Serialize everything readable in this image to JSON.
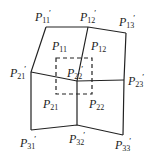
{
  "diagram": {
    "type": "bilinear-patch-mesh",
    "colors": {
      "stroke": "#222222",
      "background": "#ffffff"
    },
    "control_points": [
      {
        "id": "p11",
        "base": "P",
        "sub": "11",
        "prime": "′",
        "x": 46,
        "y": 27
      },
      {
        "id": "p12",
        "base": "P",
        "sub": "12",
        "prime": "′",
        "x": 88,
        "y": 27
      },
      {
        "id": "p13",
        "base": "P",
        "sub": "13",
        "prime": "′",
        "x": 126,
        "y": 33
      },
      {
        "id": "p21",
        "base": "P",
        "sub": "21",
        "prime": "′",
        "x": 31,
        "y": 72
      },
      {
        "id": "p22",
        "base": "P",
        "sub": "22",
        "prime": "′",
        "x": 77,
        "y": 81
      },
      {
        "id": "p23",
        "base": "P",
        "sub": "23",
        "prime": "′",
        "x": 124,
        "y": 80
      },
      {
        "id": "p31",
        "base": "P",
        "sub": "31",
        "prime": "′",
        "x": 31,
        "y": 130
      },
      {
        "id": "p32",
        "base": "P",
        "sub": "32",
        "prime": "′",
        "x": 77,
        "y": 125
      },
      {
        "id": "p33",
        "base": "P",
        "sub": "33",
        "prime": "′",
        "x": 123,
        "y": 135
      }
    ],
    "cells": [
      {
        "id": "c11",
        "base": "P",
        "sub": "11"
      },
      {
        "id": "c12",
        "base": "P",
        "sub": "12"
      },
      {
        "id": "c21",
        "base": "P",
        "sub": "21"
      },
      {
        "id": "c22",
        "base": "P",
        "sub": "22"
      }
    ],
    "dashed_square": {
      "x": 56,
      "y": 58,
      "w": 36,
      "h": 36
    }
  }
}
